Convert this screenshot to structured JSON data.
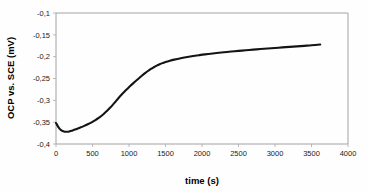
{
  "chart_data": {
    "type": "line",
    "title": "",
    "subtitle": "",
    "xlabel": "time (s)",
    "ylabel": "OCP vs. SCE (mV)",
    "xlim": [
      0,
      4000
    ],
    "ylim": [
      -0.4,
      -0.1
    ],
    "xticks": [
      0,
      500,
      1000,
      1500,
      2000,
      2500,
      3000,
      3500,
      4000
    ],
    "xtick_labels": [
      "0",
      "500",
      "1000",
      "1500",
      "2000",
      "2500",
      "3000",
      "3500",
      "4000"
    ],
    "yticks": [
      -0.4,
      -0.35,
      -0.3,
      -0.25,
      -0.2,
      -0.15,
      -0.1
    ],
    "ytick_labels": [
      "-0,4",
      "-0,35",
      "-0,3",
      "-0,25",
      "-0,2",
      "-0,15",
      "-0,1"
    ],
    "grid": false,
    "legend": false,
    "legend_position": "none",
    "decimal_separator": ",",
    "line_color": "#141414",
    "line_width": 2.1,
    "frame_color": "#9a9a9a",
    "background_color": "#fefefe",
    "series": [
      {
        "name": "OCP",
        "x": [
          0,
          20,
          40,
          60,
          80,
          100,
          120,
          140,
          160,
          180,
          200,
          230,
          260,
          300,
          340,
          380,
          420,
          460,
          500,
          540,
          580,
          620,
          660,
          700,
          740,
          780,
          820,
          860,
          900,
          940,
          980,
          1020,
          1060,
          1100,
          1140,
          1180,
          1220,
          1260,
          1300,
          1340,
          1380,
          1420,
          1460,
          1500,
          1560,
          1620,
          1680,
          1740,
          1800,
          1880,
          1960,
          2040,
          2120,
          2200,
          2300,
          2400,
          2500,
          2600,
          2700,
          2800,
          2900,
          3000,
          3100,
          3200,
          3300,
          3400,
          3500,
          3620
        ],
        "y": [
          -0.352,
          -0.358,
          -0.363,
          -0.367,
          -0.3695,
          -0.371,
          -0.3718,
          -0.372,
          -0.3718,
          -0.3712,
          -0.3703,
          -0.3688,
          -0.367,
          -0.3645,
          -0.3618,
          -0.359,
          -0.356,
          -0.3528,
          -0.3492,
          -0.3452,
          -0.3408,
          -0.3358,
          -0.3302,
          -0.324,
          -0.3172,
          -0.3098,
          -0.302,
          -0.2942,
          -0.2868,
          -0.2798,
          -0.2732,
          -0.2668,
          -0.2606,
          -0.2546,
          -0.2488,
          -0.2432,
          -0.2378,
          -0.2328,
          -0.2282,
          -0.2242,
          -0.2206,
          -0.2175,
          -0.2148,
          -0.2124,
          -0.2094,
          -0.2068,
          -0.2046,
          -0.2026,
          -0.2008,
          -0.1986,
          -0.1966,
          -0.1948,
          -0.1932,
          -0.1917,
          -0.1899,
          -0.1883,
          -0.1868,
          -0.1853,
          -0.1839,
          -0.1826,
          -0.1813,
          -0.18,
          -0.1788,
          -0.1776,
          -0.1764,
          -0.1752,
          -0.174,
          -0.1722
        ]
      }
    ],
    "notes": {
      "initial_value": -0.352,
      "minimum_value": -0.372,
      "minimum_time": 150,
      "final_value": -0.172,
      "final_time": 3620
    }
  }
}
